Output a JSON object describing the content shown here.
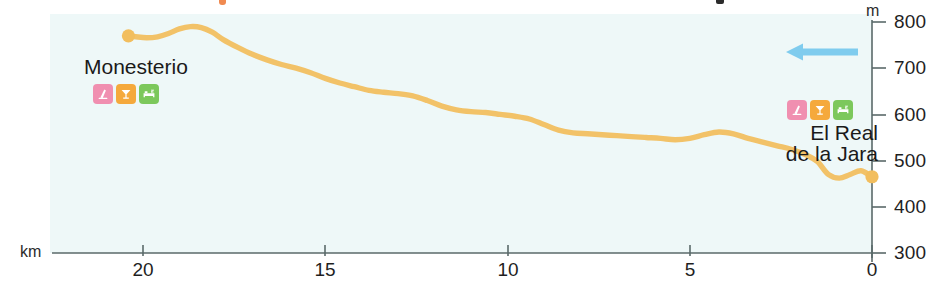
{
  "chart_data": {
    "type": "area",
    "title": "",
    "xlabel": "km",
    "ylabel": "m",
    "xlim": [
      20.8,
      0
    ],
    "ylim": [
      300,
      800
    ],
    "x_reversed": true,
    "xticks": [
      20,
      15,
      10,
      5,
      0
    ],
    "yticks": [
      300,
      400,
      500,
      600,
      700,
      800
    ],
    "grid": false,
    "series": [
      {
        "name": "Elevation profile Monesterio – El Real de la Jara",
        "units": "m",
        "color": "#F2C268",
        "x": [
          20.4,
          20.2,
          19.9,
          19.6,
          19.3,
          19.0,
          18.7,
          18.4,
          18.1,
          17.8,
          17.4,
          17.0,
          16.6,
          16.2,
          15.8,
          15.4,
          15.0,
          14.6,
          14.2,
          13.8,
          13.4,
          13.0,
          12.6,
          12.2,
          11.8,
          11.4,
          11.0,
          10.6,
          10.2,
          9.8,
          9.4,
          9.0,
          8.6,
          8.2,
          7.8,
          7.4,
          7.0,
          6.6,
          6.2,
          5.8,
          5.4,
          5.0,
          4.6,
          4.2,
          3.8,
          3.4,
          3.0,
          2.6,
          2.2,
          1.8,
          1.5,
          1.2,
          0.9,
          0.6,
          0.3,
          0.0
        ],
        "y": [
          770,
          768,
          766,
          768,
          775,
          785,
          790,
          788,
          778,
          762,
          745,
          730,
          718,
          708,
          700,
          690,
          678,
          668,
          660,
          652,
          648,
          645,
          640,
          630,
          618,
          610,
          606,
          604,
          600,
          596,
          590,
          578,
          566,
          560,
          558,
          556,
          554,
          552,
          550,
          548,
          545,
          548,
          556,
          562,
          558,
          548,
          540,
          532,
          524,
          512,
          498,
          470,
          462,
          470,
          478,
          465
        ]
      }
    ],
    "markers": [
      {
        "name": "Monesterio",
        "x": 20.4,
        "y": 770,
        "color": "#F2BE5E"
      },
      {
        "name": "El Real de la Jara",
        "x": 0.0,
        "y": 465,
        "color": "#F2BE5E"
      }
    ]
  },
  "axes": {
    "y_unit_label": "m",
    "x_unit_label": "km",
    "y_tick_labels": [
      "800",
      "700",
      "600",
      "500",
      "400",
      "300"
    ],
    "x_tick_labels": [
      "20",
      "15",
      "10",
      "5",
      "0"
    ]
  },
  "places": {
    "start": {
      "name": "Monesterio",
      "amenities": [
        {
          "icon": "monument-icon",
          "label": "Monument / sight",
          "bg": "#F08FB0"
        },
        {
          "icon": "cocktail-icon",
          "label": "Bar / restaurant",
          "bg": "#F5A93C"
        },
        {
          "icon": "bed-icon",
          "label": "Accommodation",
          "bg": "#7CC85C"
        }
      ]
    },
    "end": {
      "name_line1": "El Real",
      "name_line2": "de la Jara",
      "amenities": [
        {
          "icon": "monument-icon",
          "label": "Monument / sight",
          "bg": "#F08FB0"
        },
        {
          "icon": "cocktail-icon",
          "label": "Bar / restaurant",
          "bg": "#F5A93C"
        },
        {
          "icon": "bed-icon",
          "label": "Accommodation",
          "bg": "#7CC85C"
        }
      ]
    }
  },
  "direction_arrow": {
    "name": "direction-of-travel-arrow",
    "points": "left",
    "color": "#7FCCEE"
  },
  "colors": {
    "track": "#F2C268",
    "panel_bg": "#eef8f8",
    "axis": "#5a6a6a",
    "text": "#1a1a1a"
  }
}
